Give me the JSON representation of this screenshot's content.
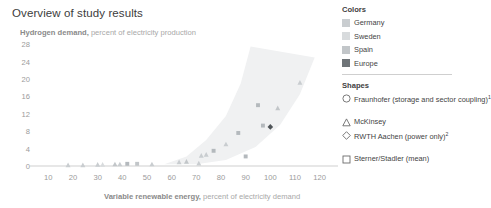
{
  "header": {
    "title": "Overview of study results",
    "subtitle_emph": "Hydrogen demand,",
    "subtitle_norm": " percent of electricity production"
  },
  "axis": {
    "x_title_emph": "Variable renewable energy,",
    "x_title_norm": " percent of electricity demand"
  },
  "legend": {
    "colors_heading": "Colors",
    "shapes_heading": "Shapes",
    "colors": [
      {
        "label": "Germany",
        "color": "#c9cdd0"
      },
      {
        "label": "Sweden",
        "color": "#d8dbdd"
      },
      {
        "label": "Spain",
        "color": "#c2c6c9"
      },
      {
        "label": "Europe",
        "color": "#6f7478"
      }
    ],
    "shapes": [
      {
        "label": "Fraunhofer (storage and sector coupling)",
        "sup": "1",
        "shape": "circle"
      },
      {
        "label": "McKinsey",
        "sup": "",
        "shape": "triangle"
      },
      {
        "label": "RWTH Aachen (power only)",
        "sup": "2",
        "shape": "diamond"
      },
      {
        "label": "Sterner/Stadler (mean)",
        "sup": "",
        "shape": "square"
      }
    ]
  },
  "chart_data": {
    "type": "scatter",
    "title": "Overview of study results",
    "xlabel": "Variable renewable energy, percent of electricity demand",
    "ylabel": "Hydrogen demand, percent of electricity production",
    "xlim": [
      5,
      125
    ],
    "ylim": [
      0,
      29
    ],
    "xticks": [
      10,
      20,
      30,
      40,
      50,
      60,
      70,
      80,
      90,
      100,
      110,
      120
    ],
    "yticks": [
      0,
      4,
      8,
      12,
      16,
      20,
      24,
      28
    ],
    "grid": false,
    "legend_position": "right",
    "band": {
      "label": "uncertainty envelope",
      "fill": "#f0f1f2",
      "upper": [
        [
          57,
          0.4
        ],
        [
          66,
          2.2
        ],
        [
          74,
          6.0
        ],
        [
          82,
          11.5
        ],
        [
          88,
          19.0
        ],
        [
          92,
          27.5
        ],
        [
          118,
          25.0
        ],
        [
          112,
          16.5
        ],
        [
          104,
          9.5
        ],
        [
          94,
          4.4
        ],
        [
          82,
          1.4
        ],
        [
          70,
          0.4
        ],
        [
          57,
          0.4
        ]
      ]
    },
    "series": [
      {
        "name": "McKinsey",
        "shape": "triangle",
        "points": [
          {
            "x": 18,
            "y": 0.2,
            "color": "#c9cdd0"
          },
          {
            "x": 24,
            "y": 0.2,
            "color": "#c9cdd0"
          },
          {
            "x": 30,
            "y": 0.3,
            "color": "#c9cdd0"
          },
          {
            "x": 32,
            "y": 0.3,
            "color": "#d8dbdd"
          },
          {
            "x": 37,
            "y": 0.4,
            "color": "#c2c6c9"
          },
          {
            "x": 39,
            "y": 0.4,
            "color": "#c9cdd0"
          },
          {
            "x": 52,
            "y": 0.4,
            "color": "#c9cdd0"
          },
          {
            "x": 63,
            "y": 0.9,
            "color": "#c9cdd0"
          },
          {
            "x": 66,
            "y": 1.0,
            "color": "#c2c6c9"
          },
          {
            "x": 72,
            "y": 2.4,
            "color": "#c9cdd0"
          },
          {
            "x": 74,
            "y": 2.6,
            "color": "#c9cdd0"
          },
          {
            "x": 71,
            "y": 0.6,
            "color": "#c9cdd0"
          },
          {
            "x": 82,
            "y": 5.0,
            "color": "#c9cdd0"
          },
          {
            "x": 103,
            "y": 13.3,
            "color": "#c2c6c9"
          },
          {
            "x": 112,
            "y": 19.2,
            "color": "#c9cdd0"
          }
        ]
      },
      {
        "name": "Sterner/Stadler (mean)",
        "shape": "square",
        "points": [
          {
            "x": 42,
            "y": 0.5,
            "color": "#b4b9bd"
          },
          {
            "x": 46,
            "y": 0.5,
            "color": "#c2c6c9"
          },
          {
            "x": 77,
            "y": 3.5,
            "color": "#b4b9bd"
          },
          {
            "x": 87,
            "y": 7.6,
            "color": "#b4b9bd"
          },
          {
            "x": 90,
            "y": 2.2,
            "color": "#b4b9bd"
          },
          {
            "x": 95,
            "y": 14.0,
            "color": "#b4b9bd"
          },
          {
            "x": 97,
            "y": 9.3,
            "color": "#b4b9bd"
          }
        ]
      },
      {
        "name": "Europe (Sterner/Stadler)",
        "shape": "diamond",
        "points": [
          {
            "x": 100,
            "y": 9.0,
            "color": "#4f5458"
          }
        ]
      }
    ]
  }
}
